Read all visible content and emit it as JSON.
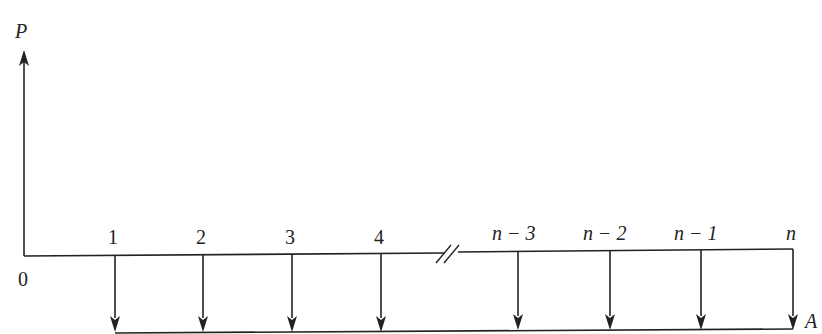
{
  "diagram": {
    "type": "cash-flow-diagram",
    "present_value_label": "P",
    "annuity_label": "A",
    "origin_label": "0",
    "periods": [
      {
        "label": "1",
        "x": 115
      },
      {
        "label": "2",
        "x": 203
      },
      {
        "label": "3",
        "x": 292
      },
      {
        "label": "4",
        "x": 381
      },
      {
        "label": "n − 3",
        "x": 518
      },
      {
        "label": "n − 2",
        "x": 610
      },
      {
        "label": "n − 1",
        "x": 701
      },
      {
        "label": "n",
        "x": 793
      }
    ],
    "break_marker": "//",
    "line_color": "#222222",
    "background": "#ffffff"
  }
}
